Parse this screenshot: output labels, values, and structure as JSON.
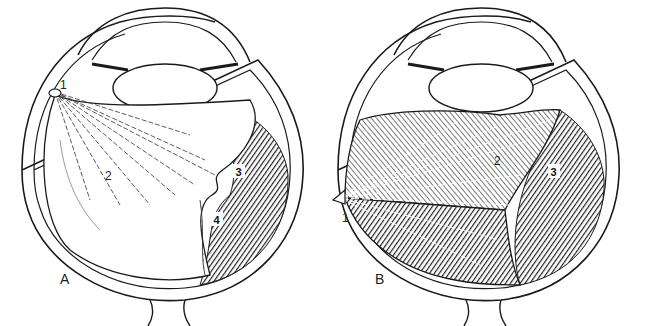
{
  "figure": {
    "panels": [
      {
        "id": "A",
        "label": "A",
        "annotations": [
          {
            "number": "1",
            "boxed": false
          },
          {
            "number": "2",
            "boxed": false
          },
          {
            "number": "3",
            "boxed": true
          },
          {
            "number": "4",
            "boxed": true
          }
        ]
      },
      {
        "id": "B",
        "label": "B",
        "annotations": [
          {
            "number": "1",
            "boxed": false
          },
          {
            "number": "2",
            "boxed": false
          },
          {
            "number": "3",
            "boxed": true
          }
        ]
      }
    ],
    "colors": {
      "ink": "#1a1a1a",
      "paper": "#ffffff",
      "shade": "#3a3a3a"
    }
  }
}
